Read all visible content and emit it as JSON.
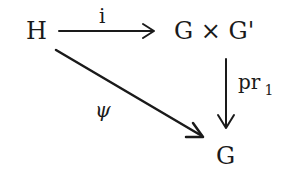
{
  "diagram": {
    "type": "commutative-diagram",
    "nodes": {
      "source": "H",
      "product": "G × G'",
      "target": "G"
    },
    "arrows": {
      "inclusion": {
        "from": "H",
        "to": "G × G'",
        "label": "i"
      },
      "projection": {
        "from": "G × G'",
        "to": "G",
        "label_main": "pr",
        "label_sub": "1"
      },
      "diagonal": {
        "from": "H",
        "to": "G",
        "label": "ψ"
      }
    },
    "colors": {
      "ink": "#1a1a1a",
      "background": "#ffffff"
    }
  }
}
